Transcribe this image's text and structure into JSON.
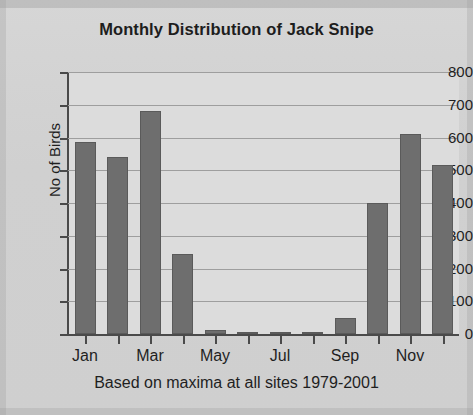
{
  "chart_data": {
    "type": "bar",
    "title": "Monthly Distribution of Jack Snipe",
    "xlabel": "Based on maxima at all sites 1979-2001",
    "ylabel": "No of Birds",
    "categories": [
      "Jan",
      "Feb",
      "Mar",
      "Apr",
      "May",
      "Jun",
      "Jul",
      "Aug",
      "Sep",
      "Oct",
      "Nov",
      "Dec"
    ],
    "visible_tick_labels": [
      "Jan",
      "Mar",
      "May",
      "Jul",
      "Sep",
      "Nov"
    ],
    "values": [
      585,
      540,
      680,
      245,
      12,
      3,
      5,
      5,
      50,
      400,
      610,
      515
    ],
    "ylim": [
      0,
      800
    ],
    "ytick_labels": [
      "0",
      "100",
      "200",
      "300",
      "400",
      "500",
      "600",
      "700",
      "800"
    ],
    "ytick_values": [
      0,
      100,
      200,
      300,
      400,
      500,
      600,
      700,
      800
    ],
    "grid": true,
    "legend": "none",
    "bar_color": "#6e6e6e",
    "plot_background": "#dcdcdc",
    "page_background": "#d2d2d2",
    "axis_color": "#4a4a4a",
    "text_color": "#1f1f1f"
  }
}
